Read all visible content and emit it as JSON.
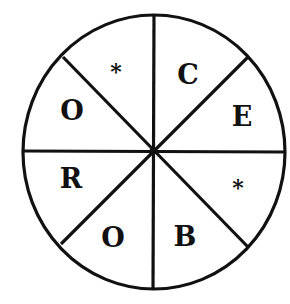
{
  "diagram": {
    "type": "letter-wheel",
    "sector_count": 8,
    "colors": {
      "stroke": "#111111",
      "background": "#ffffff",
      "text": "#111111"
    },
    "sectors": [
      {
        "position": "top-left",
        "label": "*"
      },
      {
        "position": "top-right",
        "label": "C"
      },
      {
        "position": "right-upper",
        "label": "E"
      },
      {
        "position": "right-lower",
        "label": "*"
      },
      {
        "position": "bottom-right",
        "label": "B"
      },
      {
        "position": "bottom-left",
        "label": "O"
      },
      {
        "position": "left-lower",
        "label": "R"
      },
      {
        "position": "left-upper",
        "label": "O"
      }
    ]
  }
}
